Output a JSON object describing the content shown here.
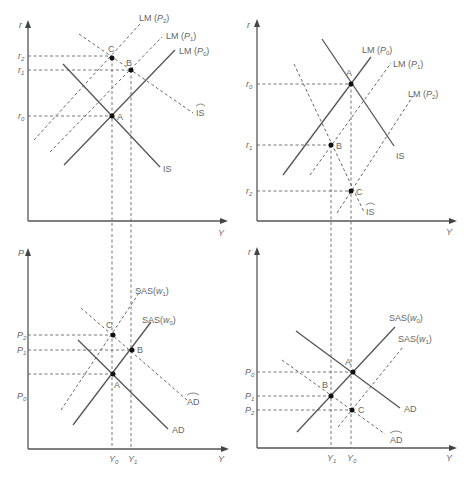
{
  "panels": {
    "top_left": {
      "y_axis_label": "r",
      "x_axis_label": "Y",
      "tick_labels": {
        "r2": "r",
        "r2_sub": "2",
        "r1": "r",
        "r1_sub": "1",
        "r0": "r",
        "r0_sub": "0"
      },
      "curves": {
        "lm_p2": {
          "main": "LM (",
          "var": "P",
          "sub": "2",
          "end": ")"
        },
        "lm_p1": {
          "main": "LM (",
          "var": "P",
          "sub": "1",
          "end": ")"
        },
        "lm_p0": {
          "main": "LM (",
          "var": "P",
          "sub": "0",
          "end": ")"
        },
        "is": "IS",
        "is_hat": "IS"
      },
      "points": {
        "a": "A",
        "b": "B",
        "c": "C"
      }
    },
    "top_right": {
      "y_axis_label": "r",
      "x_axis_label": "Y",
      "tick_labels": {
        "r0": "r",
        "r0_sub": "0",
        "r1": "r",
        "r1_sub": "1",
        "r2": "r",
        "r2_sub": "2"
      },
      "curves": {
        "lm_p0": {
          "main": "LM (",
          "var": "P",
          "sub": "0",
          "end": ")"
        },
        "lm_p1": {
          "main": "LM (",
          "var": "P",
          "sub": "1",
          "end": ")"
        },
        "lm_p2": {
          "main": "LM (",
          "var": "P",
          "sub": "2",
          "end": ")"
        },
        "is": "IS",
        "is_hat": "IS"
      },
      "points": {
        "a": "A",
        "b": "B",
        "c": "C"
      }
    },
    "bottom_left": {
      "y_axis_label": "P",
      "x_axis_label": "Y",
      "tick_labels": {
        "p2": "P",
        "p2_sub": "2",
        "p1": "P",
        "p1_sub": "1",
        "p0": "P",
        "p0_sub": "0",
        "y0": "Y",
        "y0_sub": "0",
        "y1": "Y",
        "y1_sub": "1"
      },
      "curves": {
        "sas_w1": {
          "main": "SAS(",
          "var": "w",
          "sub": "1",
          "end": ")"
        },
        "sas_w0": {
          "main": "SAS(",
          "var": "w",
          "sub": "0",
          "end": ")"
        },
        "ad": "AD",
        "ad_hat": "AD"
      },
      "points": {
        "a": "A",
        "b": "B",
        "c": "C"
      }
    },
    "bottom_right": {
      "y_axis_label": "r",
      "x_axis_label": "Y",
      "tick_labels": {
        "p0": "P",
        "p0_sub": "0",
        "p1": "P",
        "p1_sub": "1",
        "p2": "P",
        "p2_sub": "2",
        "y1": "Y",
        "y1_sub": "1",
        "y0": "Y",
        "y0_sub": "0"
      },
      "curves": {
        "sas_w0": {
          "main": "SAS(",
          "var": "w",
          "sub": "0",
          "end": ")"
        },
        "sas_w1": {
          "main": "SAS(",
          "var": "w",
          "sub": "1",
          "end": ")"
        },
        "ad": "AD",
        "ad_hat": "AD"
      },
      "points": {
        "a": "A",
        "b": "B",
        "c": "C"
      }
    }
  }
}
